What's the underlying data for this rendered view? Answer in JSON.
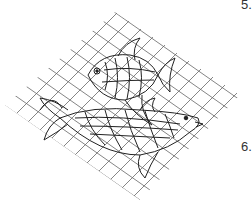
{
  "illustration": {
    "subject": "two fish caught in a fishing net",
    "style": "black line art on white",
    "colors": {
      "line": "#333333",
      "net": "#555555",
      "background": "#ffffff"
    }
  },
  "list_markers": [
    "5.",
    "6."
  ]
}
